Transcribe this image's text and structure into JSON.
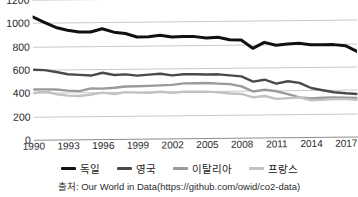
{
  "chart_data": {
    "type": "line",
    "title": "",
    "xlabel": "",
    "ylabel": "",
    "xlim": [
      1990,
      2018
    ],
    "ylim": [
      0,
      1200
    ],
    "grid": true,
    "legend_position": "bottom",
    "x": [
      1990,
      1991,
      1992,
      1993,
      1994,
      1995,
      1996,
      1997,
      1998,
      1999,
      2000,
      2001,
      2002,
      2003,
      2004,
      2005,
      2006,
      2007,
      2008,
      2009,
      2010,
      2011,
      2012,
      2013,
      2014,
      2015,
      2016,
      2017,
      2018
    ],
    "xticks": [
      "1990",
      "1993",
      "1996",
      "1999",
      "2002",
      "2005",
      "2008",
      "2011",
      "2014",
      "2017"
    ],
    "yticks": [
      "0",
      "200",
      "400",
      "600",
      "800",
      "1000",
      "1200"
    ],
    "series": [
      {
        "name": "독일",
        "color": "#111111",
        "width": 3.0,
        "values": [
          1052,
          1005,
          960,
          935,
          920,
          918,
          945,
          915,
          903,
          872,
          872,
          885,
          868,
          872,
          870,
          858,
          862,
          840,
          838,
          765,
          815,
          790,
          800,
          805,
          790,
          790,
          790,
          780,
          730
        ]
      },
      {
        "name": "영국",
        "color": "#4a4a4a",
        "width": 2.4,
        "values": [
          600,
          595,
          578,
          558,
          552,
          545,
          568,
          548,
          552,
          540,
          548,
          555,
          540,
          548,
          548,
          545,
          545,
          535,
          525,
          480,
          495,
          460,
          480,
          465,
          420,
          400,
          382,
          372,
          365
        ]
      },
      {
        "name": "이탈리아",
        "color": "#9a9a9a",
        "width": 2.4,
        "values": [
          430,
          430,
          428,
          418,
          412,
          435,
          432,
          438,
          448,
          450,
          452,
          455,
          458,
          470,
          470,
          472,
          465,
          460,
          440,
          395,
          410,
          395,
          370,
          340,
          330,
          335,
          338,
          335,
          330
        ]
      },
      {
        "name": "프랑스",
        "color": "#c2c2c2",
        "width": 2.4,
        "values": [
          398,
          412,
          388,
          375,
          370,
          382,
          398,
          385,
          400,
          395,
          393,
          400,
          390,
          398,
          398,
          398,
          390,
          380,
          375,
          345,
          355,
          330,
          335,
          340,
          315,
          318,
          325,
          322,
          315
        ]
      }
    ]
  },
  "legend": {
    "items": [
      {
        "label": "독일",
        "color": "#111111"
      },
      {
        "label": "영국",
        "color": "#4a4a4a"
      },
      {
        "label": "이탈리아",
        "color": "#9a9a9a"
      },
      {
        "label": "프랑스",
        "color": "#c2c2c2"
      }
    ]
  },
  "source": {
    "text": "출처: Our World in Data(https://github.com/owid/co2-data)"
  },
  "title_fragment": {
    "text": ""
  }
}
